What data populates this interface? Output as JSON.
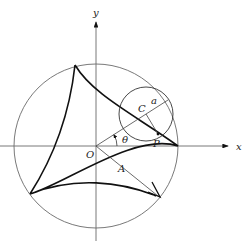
{
  "diagram": {
    "type": "deltoid-hypocycloid",
    "labels": {
      "y_axis": "y",
      "x_axis": "x",
      "origin": "O",
      "center_small": "C",
      "radius_small": "a",
      "angle": "θ",
      "point": "P",
      "radius_large": "A"
    },
    "colors": {
      "stroke": "#1a1a1a",
      "circle": "#6a6a6a",
      "background": "#ffffff"
    }
  }
}
